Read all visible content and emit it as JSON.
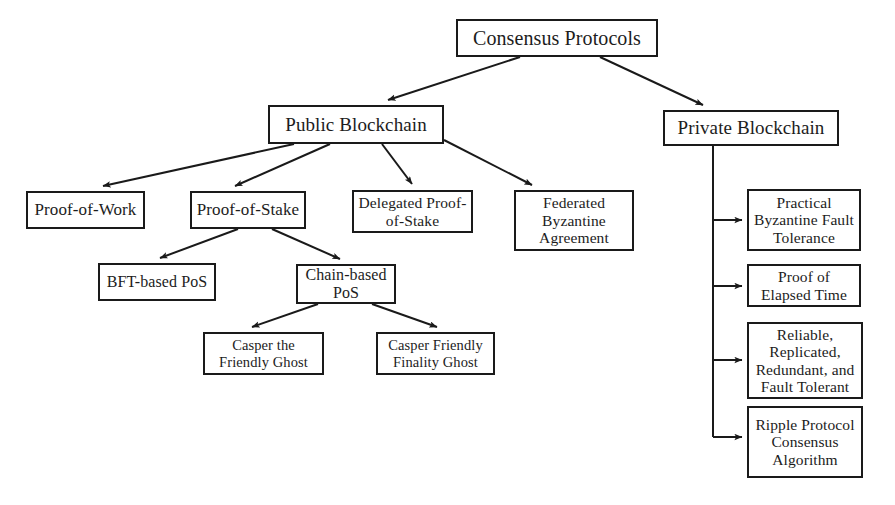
{
  "diagram": {
    "type": "tree-diagram",
    "background_color": "#ffffff",
    "line_color": "#1a1a1a",
    "text_color": "#1c1c1c",
    "nodes": {
      "root": {
        "label": "Consensus Protocols",
        "x": 456,
        "y": 19,
        "w": 202,
        "h": 38
      },
      "public_blockchain": {
        "label": "Public Blockchain",
        "x": 268,
        "y": 105,
        "w": 176,
        "h": 39
      },
      "private_blockchain": {
        "label": "Private Blockchain",
        "x": 663,
        "y": 110,
        "w": 176,
        "h": 36
      },
      "proof_of_work": {
        "label": "Proof-of-Work",
        "x": 26,
        "y": 191,
        "w": 119,
        "h": 38
      },
      "proof_of_stake": {
        "label": "Proof-of-Stake",
        "x": 190,
        "y": 191,
        "w": 116,
        "h": 38
      },
      "delegated_proof_of_stake": {
        "label": "Delegated Proof-\nof-Stake",
        "x": 352,
        "y": 190,
        "w": 121,
        "h": 43
      },
      "federated_byzantine_agreement": {
        "label": "Federated\nByzantine\nAgreement",
        "x": 514,
        "y": 190,
        "w": 120,
        "h": 61
      },
      "bft_based_pos": {
        "label": "BFT-based PoS",
        "x": 98,
        "y": 263,
        "w": 118,
        "h": 38
      },
      "chain_based_pos": {
        "label": "Chain-based\nPoS",
        "x": 296,
        "y": 264,
        "w": 100,
        "h": 40
      },
      "casper_the_friendly_ghost": {
        "label": "Casper the\nFriendly Ghost",
        "x": 203,
        "y": 332,
        "w": 121,
        "h": 43
      },
      "casper_friendly_finality_ghost": {
        "label": "Casper Friendly\nFinality Ghost",
        "x": 376,
        "y": 332,
        "w": 119,
        "h": 43
      },
      "practical_byzantine_fault_tolerance": {
        "label": "Practical\nByzantine Fault\nTolerance",
        "x": 747,
        "y": 189,
        "w": 114,
        "h": 62
      },
      "proof_of_elapsed_time": {
        "label": "Proof of\nElapsed Time",
        "x": 747,
        "y": 264,
        "w": 114,
        "h": 43
      },
      "reliable_replicated_redundant_fault_tolerant": {
        "label": "Reliable,\nReplicated,\nRedundant, and\nFault Tolerant",
        "x": 747,
        "y": 322,
        "w": 116,
        "h": 77
      },
      "ripple_protocol_consensus_algorithm": {
        "label": "Ripple Protocol\nConsensus\nAlgorithm",
        "x": 747,
        "y": 406,
        "w": 116,
        "h": 72
      }
    },
    "edges": [
      {
        "from": "root",
        "to": "public_blockchain",
        "style": "diagonal-arrow"
      },
      {
        "from": "root",
        "to": "private_blockchain",
        "style": "diagonal-arrow"
      },
      {
        "from": "public_blockchain",
        "to": "proof_of_work",
        "style": "diagonal-arrow"
      },
      {
        "from": "public_blockchain",
        "to": "proof_of_stake",
        "style": "diagonal-arrow"
      },
      {
        "from": "public_blockchain",
        "to": "delegated_proof_of_stake",
        "style": "diagonal-arrow"
      },
      {
        "from": "public_blockchain",
        "to": "federated_byzantine_agreement",
        "style": "diagonal-arrow"
      },
      {
        "from": "proof_of_stake",
        "to": "bft_based_pos",
        "style": "diagonal-arrow"
      },
      {
        "from": "proof_of_stake",
        "to": "chain_based_pos",
        "style": "diagonal-arrow"
      },
      {
        "from": "chain_based_pos",
        "to": "casper_the_friendly_ghost",
        "style": "diagonal-arrow"
      },
      {
        "from": "chain_based_pos",
        "to": "casper_friendly_finality_ghost",
        "style": "diagonal-arrow"
      },
      {
        "from": "private_blockchain",
        "to": "practical_byzantine_fault_tolerance",
        "style": "orthogonal-arrow"
      },
      {
        "from": "private_blockchain",
        "to": "proof_of_elapsed_time",
        "style": "orthogonal-arrow"
      },
      {
        "from": "private_blockchain",
        "to": "reliable_replicated_redundant_fault_tolerant",
        "style": "orthogonal-arrow"
      },
      {
        "from": "private_blockchain",
        "to": "ripple_protocol_consensus_algorithm",
        "style": "orthogonal-arrow"
      }
    ]
  }
}
